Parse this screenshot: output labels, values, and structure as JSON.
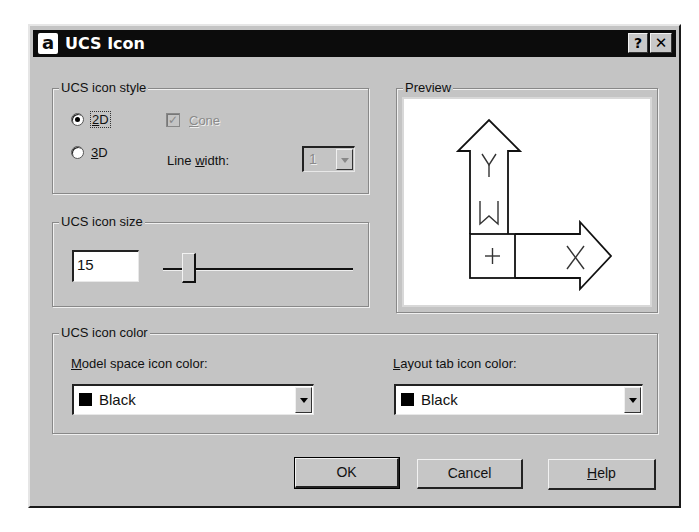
{
  "window": {
    "title": "UCS Icon",
    "app_icon_glyph": "a",
    "help_button": "?",
    "close_button": "✕"
  },
  "icon_style": {
    "group_label": "UCS icon style",
    "radio_2d": {
      "label": "2D",
      "mnemonic": "2",
      "rest": "D",
      "selected": true
    },
    "radio_3d": {
      "label": "3D",
      "mnemonic": "3",
      "rest": "D",
      "selected": false
    },
    "cone": {
      "label": "Cone",
      "mnemonic": "C",
      "rest": "one",
      "checked": true,
      "enabled": false
    },
    "line_width": {
      "label_pre": "Line ",
      "mnemonic": "w",
      "label_post": "idth:",
      "value": "1",
      "enabled": false
    }
  },
  "icon_size": {
    "group_label": "UCS icon size",
    "value": "15",
    "slider_min": 5,
    "slider_max": 95,
    "slider_value": 15
  },
  "preview": {
    "group_label": "Preview",
    "labels": {
      "y": "Y",
      "w": "W",
      "plus": "+",
      "x": "X"
    }
  },
  "icon_color": {
    "group_label": "UCS icon color",
    "model_space": {
      "label_mnemonic": "M",
      "label_rest": "odel space icon color:",
      "value": "Black",
      "swatch": "#000000"
    },
    "layout_tab": {
      "label_mnemonic": "L",
      "label_rest": "ayout tab icon color:",
      "value": "Black",
      "swatch": "#000000"
    }
  },
  "buttons": {
    "ok": "OK",
    "cancel": "Cancel",
    "help_mnemonic": "H",
    "help_rest": "elp"
  },
  "colors": {
    "dialog_bg": "#c4c4c4",
    "titlebar_bg": "#0c0c0c",
    "preview_bg": "#ffffff"
  }
}
